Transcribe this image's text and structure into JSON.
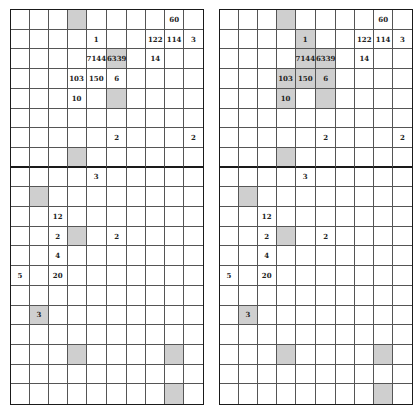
{
  "grid_rows": 20,
  "grid_cols": 10,
  "section_divider_after_row": 7,
  "colors": {
    "shade": "#cfcfcf",
    "line": "#555555",
    "border": "#1a1a1a"
  },
  "values": [
    {
      "r": 0,
      "c": 8,
      "v": "60"
    },
    {
      "r": 1,
      "c": 4,
      "v": "1"
    },
    {
      "r": 1,
      "c": 7,
      "v": "122"
    },
    {
      "r": 1,
      "c": 8,
      "v": "114"
    },
    {
      "r": 1,
      "c": 9,
      "v": "3"
    },
    {
      "r": 2,
      "c": 4,
      "v": "7144"
    },
    {
      "r": 2,
      "c": 5,
      "v": "6339"
    },
    {
      "r": 2,
      "c": 7,
      "v": "14"
    },
    {
      "r": 3,
      "c": 3,
      "v": "103"
    },
    {
      "r": 3,
      "c": 4,
      "v": "150"
    },
    {
      "r": 3,
      "c": 5,
      "v": "6"
    },
    {
      "r": 4,
      "c": 3,
      "v": "10"
    },
    {
      "r": 6,
      "c": 5,
      "v": "2"
    },
    {
      "r": 6,
      "c": 9,
      "v": "2"
    },
    {
      "r": 8,
      "c": 4,
      "v": "3"
    },
    {
      "r": 10,
      "c": 2,
      "v": "12"
    },
    {
      "r": 11,
      "c": 2,
      "v": "2"
    },
    {
      "r": 11,
      "c": 5,
      "v": "2"
    },
    {
      "r": 12,
      "c": 2,
      "v": "4"
    },
    {
      "r": 13,
      "c": 0,
      "v": "5"
    },
    {
      "r": 13,
      "c": 2,
      "v": "20"
    },
    {
      "r": 15,
      "c": 1,
      "v": "3"
    }
  ],
  "left_grid": {
    "shaded": [
      [
        0,
        3
      ],
      [
        2,
        5
      ],
      [
        4,
        5
      ],
      [
        7,
        3
      ],
      [
        9,
        1
      ],
      [
        11,
        3
      ],
      [
        15,
        1
      ],
      [
        17,
        3
      ],
      [
        17,
        8
      ],
      [
        19,
        8
      ]
    ]
  },
  "right_grid": {
    "shaded": [
      [
        0,
        3
      ],
      [
        1,
        4
      ],
      [
        2,
        4
      ],
      [
        2,
        5
      ],
      [
        3,
        3
      ],
      [
        3,
        4
      ],
      [
        3,
        5
      ],
      [
        4,
        3
      ],
      [
        4,
        5
      ],
      [
        7,
        3
      ],
      [
        9,
        1
      ],
      [
        11,
        3
      ],
      [
        15,
        1
      ],
      [
        17,
        3
      ],
      [
        17,
        8
      ],
      [
        19,
        8
      ]
    ]
  }
}
